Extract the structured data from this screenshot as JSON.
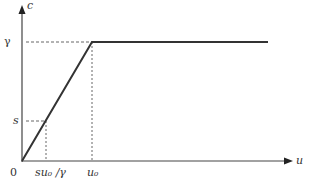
{
  "diagram": {
    "y_axis_label": "c",
    "x_axis_label": "u",
    "origin_label": "0",
    "y_ticks": {
      "gamma": "γ",
      "s": "s"
    },
    "x_ticks": {
      "s_point": "su₀ /γ",
      "u0": "u₀"
    },
    "curve": "piecewise linear: rising from origin to (u₀, γ), then constant γ",
    "colors": {
      "axis": "#444444",
      "curve": "#333333",
      "dashed": "#555555"
    }
  }
}
